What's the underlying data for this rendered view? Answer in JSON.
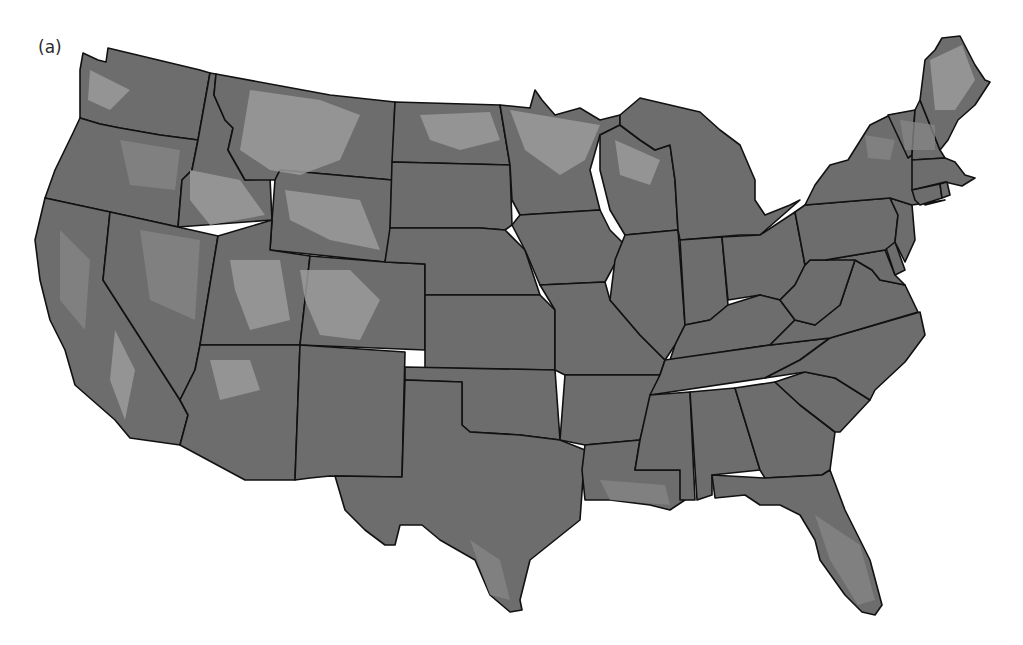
{
  "figure": {
    "panel_label": "(a)",
    "colors": {
      "background": "#ffffff",
      "lowland": "#6d6d6d",
      "upland": "#858585",
      "highland": "#9b9b9b",
      "boundary": "#111111"
    }
  },
  "map": {
    "region": "Contiguous United States",
    "states": [
      "Washington",
      "Oregon",
      "California",
      "Idaho",
      "Nevada",
      "Montana",
      "Wyoming",
      "Utah",
      "Arizona",
      "Colorado",
      "New Mexico",
      "North Dakota",
      "South Dakota",
      "Nebraska",
      "Kansas",
      "Oklahoma",
      "Texas",
      "Minnesota",
      "Iowa",
      "Missouri",
      "Arkansas",
      "Louisiana",
      "Wisconsin",
      "Illinois",
      "Michigan",
      "Indiana",
      "Ohio",
      "Kentucky",
      "Tennessee",
      "Mississippi",
      "Alabama",
      "Georgia",
      "Florida",
      "South Carolina",
      "North Carolina",
      "Virginia",
      "West Virginia",
      "Maryland",
      "Delaware",
      "Pennsylvania",
      "New Jersey",
      "New York",
      "Connecticut",
      "Rhode Island",
      "Massachusetts",
      "Vermont",
      "New Hampshire",
      "Maine"
    ]
  }
}
